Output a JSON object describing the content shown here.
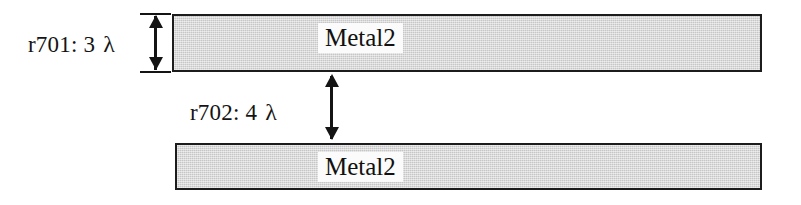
{
  "diagram": {
    "layers": [
      {
        "id": "metal2-top",
        "label": "Metal2",
        "fill_color": "#d4d4d4",
        "border_color": "#1c1c1c"
      },
      {
        "id": "metal2-bottom",
        "label": "Metal2",
        "fill_color": "#d4d4d4",
        "border_color": "#1c1c1c"
      }
    ],
    "dimensions": [
      {
        "id": "r701",
        "rule": "r701:",
        "value": "3",
        "unit": "λ",
        "full_text": "r701: 3 λ",
        "measures": "metal2-thickness",
        "arrow": "double-headed-vertical"
      },
      {
        "id": "r702",
        "rule": "r702:",
        "value": "4",
        "unit": "λ",
        "full_text": "r702: 4 λ",
        "measures": "metal2-to-metal2-spacing",
        "arrow": "double-headed-vertical"
      }
    ]
  }
}
